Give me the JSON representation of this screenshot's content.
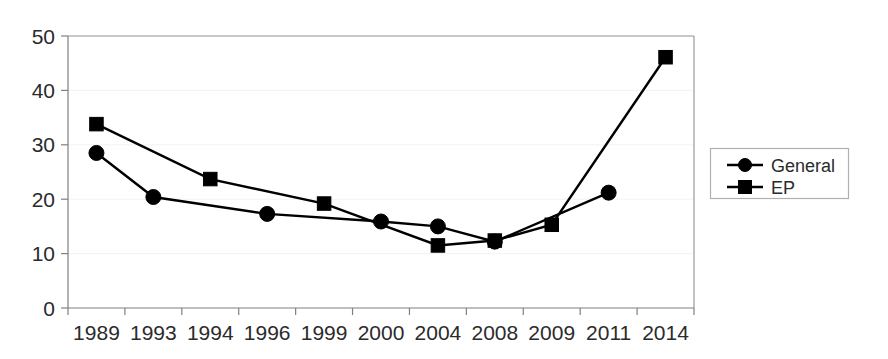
{
  "chart_data": {
    "type": "line",
    "title": "",
    "subtitle": "",
    "xlabel": "",
    "ylabel": "",
    "categories": [
      "1989",
      "1993",
      "1994",
      "1996",
      "1999",
      "2000",
      "2004",
      "2008",
      "2009",
      "2011",
      "2014"
    ],
    "ylim": [
      0,
      50
    ],
    "yticks": [
      0,
      10,
      20,
      30,
      40,
      50
    ],
    "ytick_labels": [
      "0",
      "10",
      "20",
      "30",
      "40",
      "50"
    ],
    "grid": true,
    "grid_axis": "y",
    "legend_position": "right",
    "series": [
      {
        "name": "General",
        "marker": "circle",
        "color": "#000000",
        "values": [
          28.5,
          20.4,
          null,
          17.3,
          null,
          15.9,
          15.0,
          12.2,
          null,
          21.2,
          null
        ],
        "points": [
          {
            "x": "1989",
            "y": 28.5
          },
          {
            "x": "1993",
            "y": 20.4
          },
          {
            "x": "1996",
            "y": 17.3
          },
          {
            "x": "2000",
            "y": 15.9
          },
          {
            "x": "2004",
            "y": 15.0
          },
          {
            "x": "2008",
            "y": 12.2
          },
          {
            "x": "2011",
            "y": 21.2
          }
        ]
      },
      {
        "name": "EP",
        "marker": "square",
        "color": "#000000",
        "values": [
          33.8,
          null,
          23.7,
          null,
          19.2,
          null,
          11.5,
          12.4,
          15.3,
          null,
          46.1
        ],
        "points": [
          {
            "x": "1989",
            "y": 33.8
          },
          {
            "x": "1994",
            "y": 23.7
          },
          {
            "x": "1999",
            "y": 19.2
          },
          {
            "x": "2004",
            "y": 11.5
          },
          {
            "x": "2008",
            "y": 12.4
          },
          {
            "x": "2009",
            "y": 15.3
          },
          {
            "x": "2014",
            "y": 46.1
          }
        ]
      }
    ]
  },
  "legend": {
    "entries": [
      {
        "label": "General",
        "marker": "circle"
      },
      {
        "label": "EP",
        "marker": "square"
      }
    ]
  },
  "colors": {
    "series": "#000000",
    "axis": "#808080",
    "frame": "#9a9a9a",
    "grid": "#f2f2f2",
    "text": "#2b2b2b",
    "background": "#ffffff"
  }
}
